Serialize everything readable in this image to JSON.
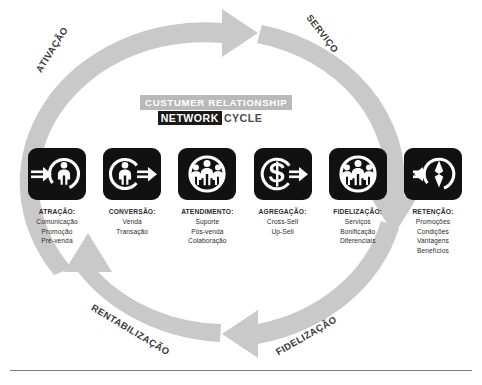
{
  "title": {
    "line1": "CUSTUMER RELATIONSHIP",
    "network": "NETWORK",
    "cycle": "CYCLE"
  },
  "arc_labels": [
    {
      "id": "ativacao",
      "text": "ATIVAÇÃO"
    },
    {
      "id": "servico",
      "text": "SERVIÇO"
    },
    {
      "id": "rentabilizacao",
      "text": "RENTABILIZAÇÃO"
    },
    {
      "id": "fidelizacao",
      "text": "FIDELIZAÇÃO"
    }
  ],
  "stages": [
    {
      "key": "atracao",
      "icon": "person-in-circle-arrow-in-icon",
      "title": "ATRAÇÃO:",
      "items": [
        "Comunicação",
        "Promoção",
        "Pré-venda"
      ]
    },
    {
      "key": "conversao",
      "icon": "person-in-circle-arrow-out-icon",
      "title": "CONVERSÃO:",
      "items": [
        "Venda",
        "Transação"
      ]
    },
    {
      "key": "atendimento",
      "icon": "people-group-in-circle-icon",
      "title": "ATENDIMENTO:",
      "items": [
        "Suporte",
        "Pós-venda",
        "Colaboração"
      ]
    },
    {
      "key": "agregacao",
      "icon": "dollar-in-circle-arrow-out-icon",
      "title": "AGREGAÇÃO:",
      "items": [
        "Cross-Sell",
        "Up-Sell"
      ]
    },
    {
      "key": "fidelizacao",
      "icon": "people-group-in-circle-icon",
      "title": "FIDELIZAÇÃO:",
      "items": [
        "Serviços",
        "Bonificação",
        "Diferenciais"
      ]
    },
    {
      "key": "retencao",
      "icon": "compass-in-circle-arrow-left-icon",
      "title": "RETENÇÃO:",
      "items": [
        "Promoções",
        "Condições",
        "Vantagens",
        "Benefícios"
      ]
    }
  ],
  "colors": {
    "ring": "#c9c9c9",
    "icon_box": "#111111",
    "title_band": "#b9b9b9",
    "title_highlight": "#1a1a1a",
    "text": "#2b2b2b",
    "background": "#ffffff"
  }
}
